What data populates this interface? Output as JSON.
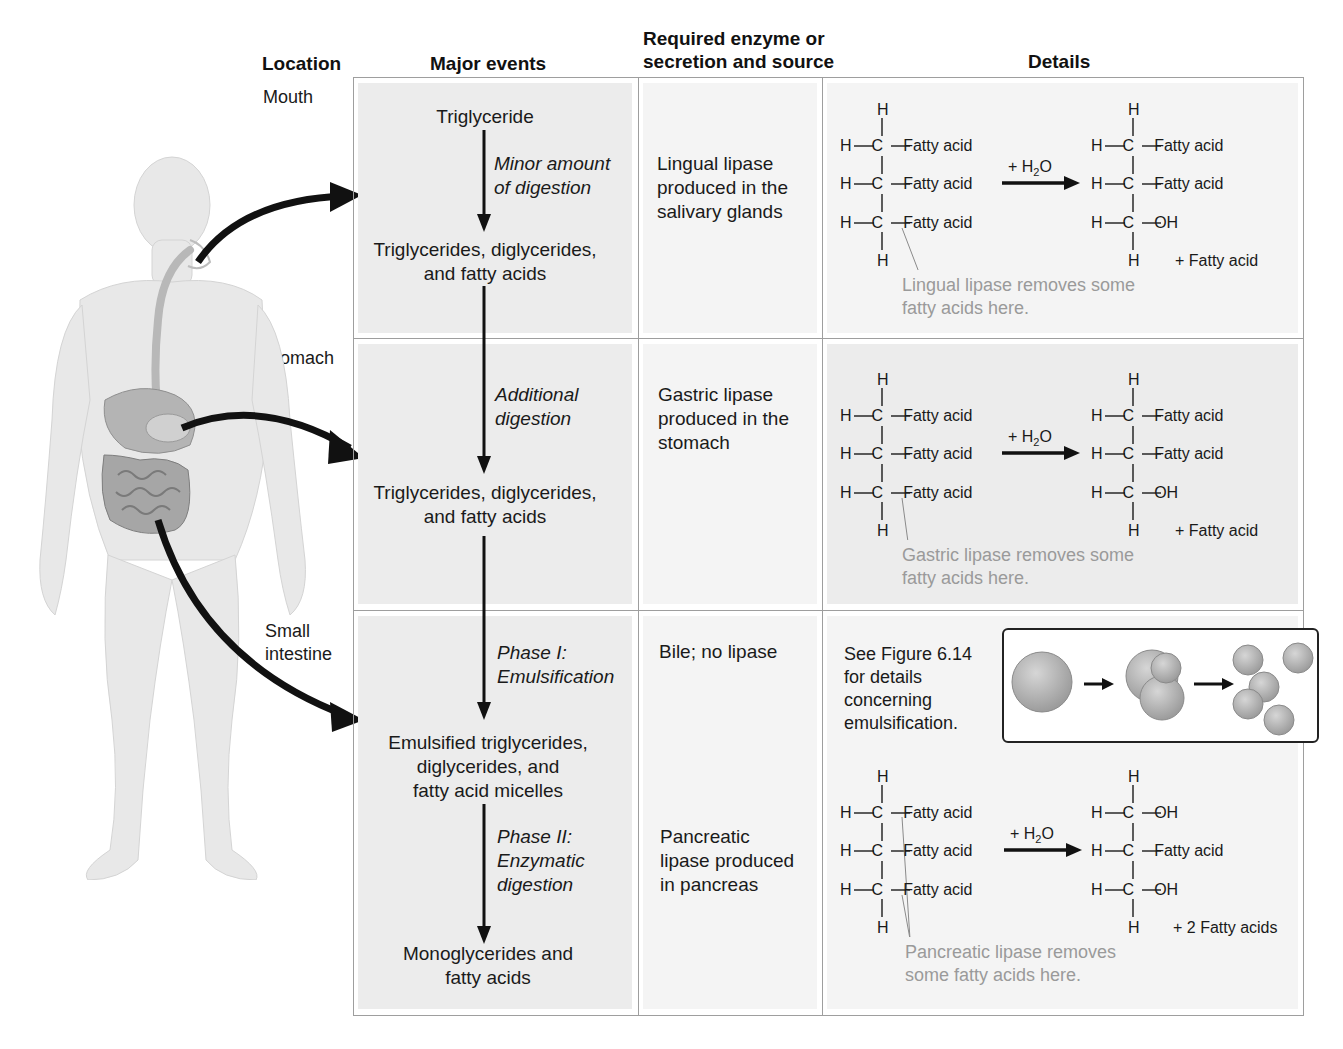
{
  "figure": {
    "header": {
      "location": "Location",
      "major_events": "Major events",
      "enzyme": [
        "Required enzyme or",
        "secretion and source"
      ],
      "details": "Details"
    },
    "locations": {
      "mouth": "Mouth",
      "stomach": "Stomach",
      "small_intestine": [
        "Small",
        "intestine"
      ]
    },
    "rows": [
      {
        "id": "mouth",
        "events": {
          "start": "Triglyceride",
          "process": [
            "Minor amount",
            "of digestion"
          ],
          "product": [
            "Triglycerides, diglycerides,",
            "and fatty acids"
          ]
        },
        "enzyme": [
          "Lingual lipase",
          "produced in the",
          "salivary glands"
        ],
        "reaction": {
          "left": [
            "Fatty acid",
            "Fatty acid",
            "Fatty acid"
          ],
          "reagent": "+ H",
          "reagent_sub": "2",
          "reagent_tail": "O",
          "right": [
            "Fatty acid",
            "Fatty acid",
            "OH"
          ],
          "byproduct": "+ Fatty acid",
          "note": [
            "Lingual lipase removes some",
            "fatty acids here."
          ]
        }
      },
      {
        "id": "stomach",
        "events": {
          "process": [
            "Additional",
            "digestion"
          ],
          "product": [
            "Triglycerides, diglycerides,",
            "and fatty acids"
          ]
        },
        "enzyme": [
          "Gastric lipase",
          "produced in the",
          "stomach"
        ],
        "reaction": {
          "left": [
            "Fatty acid",
            "Fatty acid",
            "Fatty acid"
          ],
          "reagent": "+ H",
          "reagent_sub": "2",
          "reagent_tail": "O",
          "right": [
            "Fatty acid",
            "Fatty acid",
            "OH"
          ],
          "byproduct": "+ Fatty acid",
          "note": [
            "Gastric lipase removes some",
            "fatty acids here."
          ]
        }
      },
      {
        "id": "small_intestine",
        "events": {
          "phase1": [
            "Phase I:",
            "Emulsification"
          ],
          "intermediate": [
            "Emulsified triglycerides,",
            "diglycerides, and",
            "fatty acid micelles"
          ],
          "phase2": [
            "Phase II:",
            "Enzymatic",
            "digestion"
          ],
          "product": [
            "Monoglycerides and",
            "fatty acids"
          ]
        },
        "enzyme_phase1": "Bile; no lipase",
        "enzyme_phase2": [
          "Pancreatic",
          "lipase produced",
          "in pancreas"
        ],
        "emulsification_ref": [
          "See Figure 6.14",
          "for details",
          "concerning",
          "emulsification."
        ],
        "reaction": {
          "left": [
            "Fatty acid",
            "Fatty acid",
            "Fatty acid"
          ],
          "reagent": "+ H",
          "reagent_sub": "2",
          "reagent_tail": "O",
          "right": [
            "OH",
            "Fatty acid",
            "OH"
          ],
          "byproduct": "+ 2 Fatty acids",
          "note": [
            "Pancreatic lipase removes",
            "some fatty acids here."
          ]
        }
      }
    ],
    "atoms": {
      "H": "H",
      "C": "C"
    },
    "colors": {
      "panel": "#ececec",
      "panel_light": "#f4f4f4",
      "grid": "#9e9e9e",
      "note_text": "#9a9a9a",
      "arrow": "#111111",
      "body_figure": "#e6e6e6",
      "organs": "#a9a9a9"
    }
  }
}
